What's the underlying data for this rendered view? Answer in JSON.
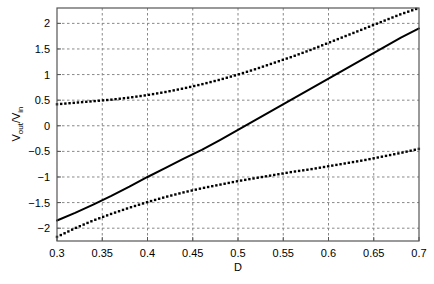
{
  "chart_data": {
    "type": "line",
    "title": "",
    "xlabel": "D",
    "ylabel": "V_out/V_in",
    "ylabel_parts": {
      "v1": "V",
      "sub1": "out",
      "slash": "/V",
      "sub2": "in"
    },
    "xlim": [
      0.3,
      0.7
    ],
    "ylim": [
      -2.25,
      2.3
    ],
    "grid": true,
    "legend": "none",
    "xticks": [
      0.3,
      0.35,
      0.4,
      0.45,
      0.5,
      0.55,
      0.6,
      0.65,
      0.7
    ],
    "xtick_labels": [
      "0.3",
      "0.35",
      "0.4",
      "0.45",
      "0.5",
      "0.55",
      "0.6",
      "0.65",
      "0.7"
    ],
    "yticks": [
      -2,
      -1.5,
      -1,
      -0.5,
      0,
      0.5,
      1,
      1.5,
      2
    ],
    "ytick_labels": [
      "−2",
      "−1.5",
      "−1",
      "−0.5",
      "0",
      "0.5",
      "1",
      "1.5",
      "2"
    ],
    "x": [
      0.3,
      0.32,
      0.34,
      0.36,
      0.38,
      0.4,
      0.42,
      0.44,
      0.46,
      0.48,
      0.5,
      0.52,
      0.54,
      0.56,
      0.58,
      0.6,
      0.62,
      0.64,
      0.66,
      0.68,
      0.7
    ],
    "series": [
      {
        "name": "upper-bound",
        "style": "dotted",
        "color": "#000000",
        "values": [
          0.42,
          0.45,
          0.48,
          0.51,
          0.55,
          0.6,
          0.66,
          0.73,
          0.81,
          0.9,
          1.0,
          1.11,
          1.23,
          1.35,
          1.48,
          1.62,
          1.76,
          1.9,
          2.04,
          2.18,
          2.3
        ]
      },
      {
        "name": "nominal",
        "style": "solid",
        "color": "#000000",
        "values": [
          -1.85,
          -1.7,
          -1.54,
          -1.37,
          -1.19,
          -1.0,
          -0.82,
          -0.64,
          -0.47,
          -0.28,
          -0.08,
          0.12,
          0.32,
          0.52,
          0.72,
          0.92,
          1.12,
          1.32,
          1.52,
          1.72,
          1.9
        ]
      },
      {
        "name": "lower-bound",
        "style": "dotted",
        "color": "#000000",
        "values": [
          -2.17,
          -2.0,
          -1.85,
          -1.72,
          -1.6,
          -1.49,
          -1.39,
          -1.3,
          -1.22,
          -1.15,
          -1.08,
          -1.02,
          -0.96,
          -0.9,
          -0.85,
          -0.79,
          -0.73,
          -0.67,
          -0.6,
          -0.53,
          -0.45
        ]
      }
    ]
  },
  "style": {
    "axis_color": "#555555",
    "grid_color": "#888888",
    "background": "#ffffff",
    "line_color": "#000000"
  },
  "geometry": {
    "plot_left": 57,
    "plot_top": 8,
    "plot_right": 419,
    "plot_bottom": 241
  }
}
